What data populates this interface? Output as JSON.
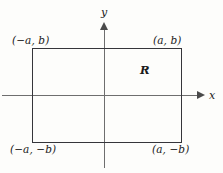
{
  "figure": {
    "background_color": "#fdfdfb",
    "axis_color": "#6e6e6e",
    "rect_color": "#35353a",
    "text_color": "#1a1a1a",
    "axes": {
      "x_label": "x",
      "y_label": "y"
    },
    "region": {
      "label": "R"
    },
    "corners": {
      "top_left": "(−a, b)",
      "top_right": "(a, b)",
      "bottom_left": "(−a, −b)",
      "bottom_right": "(a, −b)"
    }
  }
}
